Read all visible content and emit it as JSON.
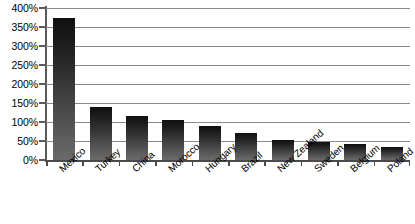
{
  "chart_data": {
    "type": "bar",
    "title": "",
    "subtitle": "",
    "xlabel": "",
    "ylabel": "",
    "categories": [
      "Mexico",
      "Turkey",
      "China",
      "Morocco",
      "Hungary",
      "Brazil",
      "New Zealand",
      "Sweden",
      "Belgium",
      "Poland"
    ],
    "values": [
      375,
      140,
      115,
      105,
      90,
      70,
      52,
      47,
      42,
      33
    ],
    "value_unit": "%",
    "ylim": [
      0,
      400
    ],
    "ytick_step": 50,
    "ytick_labels": [
      "0%",
      "50%",
      "100%",
      "150%",
      "200%",
      "250%",
      "300%",
      "350%",
      "400%"
    ],
    "ytick_values": [
      0,
      50,
      100,
      150,
      200,
      250,
      300,
      350,
      400
    ],
    "grid": true,
    "grid_axis": "y",
    "legend": false,
    "legend_position": "none",
    "series": [
      {
        "name": "",
        "values": [
          375,
          140,
          115,
          105,
          90,
          70,
          52,
          47,
          42,
          33
        ]
      }
    ],
    "bar_fill": "#2b2b2b",
    "bar_fill_gradient_top": "#101010",
    "bar_fill_gradient_bottom": "#6a6a6a",
    "gridline_color": "#8a8a8a",
    "axis_color": "#4a4a4a",
    "text_color": "#000000",
    "background_color": "#ffffff",
    "xtick_label_rotation": -42
  }
}
